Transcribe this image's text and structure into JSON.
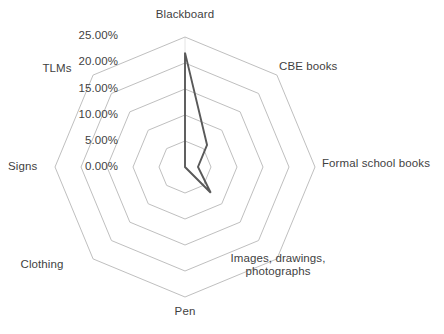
{
  "chart_data": {
    "type": "radar",
    "title": "",
    "subtitle": "",
    "xlabel": "",
    "ylabel": "",
    "categories": [
      "Blackboard",
      "CBE books",
      "Formal school books",
      "Images, drawings, photographs",
      "Pen",
      "Clothing",
      "Signs",
      "TLMs"
    ],
    "values": [
      22.0,
      6.0,
      2.5,
      7.0,
      0.0,
      0.0,
      0.0,
      0.0
    ],
    "value_unit": "%",
    "tick_labels": [
      "0.00%",
      "5.00%",
      "10.00%",
      "15.00%",
      "20.00%",
      "25.00%"
    ],
    "tick_values": [
      0,
      5,
      10,
      15,
      20,
      25
    ],
    "rlim": [
      0,
      25
    ],
    "grid": true,
    "legend": false,
    "legend_position": "none",
    "series": [
      {
        "name": "Series 1",
        "values": [
          22.0,
          6.0,
          2.5,
          7.0,
          0.0,
          0.0,
          0.0,
          0.0
        ]
      }
    ],
    "colors": {
      "grid": "#bfbfbf",
      "series_line": "#595959",
      "text": "#3f3f3f",
      "background": "#ffffff"
    }
  },
  "axis_labels": [
    {
      "text": "Blackboard",
      "x": 185,
      "y": 8,
      "w": 120,
      "align": "center"
    },
    {
      "text": "CBE books",
      "x": 279,
      "y": 60,
      "w": 120,
      "align": "left"
    },
    {
      "text": "Formal school books",
      "x": 322,
      "y": 157,
      "w": 125,
      "align": "left"
    },
    {
      "text": "Images, drawings,\nphotographs",
      "x": 278,
      "y": 252,
      "w": 110,
      "align": "center"
    },
    {
      "text": "Pen",
      "x": 185,
      "y": 305,
      "w": 60,
      "align": "center"
    },
    {
      "text": "Clothing",
      "x": 42,
      "y": 258,
      "w": 70,
      "align": "center"
    },
    {
      "text": "Signs",
      "x": 8,
      "y": 160,
      "w": 55,
      "align": "left"
    },
    {
      "text": "TLMs",
      "x": 57,
      "y": 62,
      "w": 55,
      "align": "center"
    }
  ],
  "tick_labels": [
    {
      "text": "25.00%",
      "x": 118,
      "y": 29
    },
    {
      "text": "20.00%",
      "x": 118,
      "y": 55
    },
    {
      "text": "15.00%",
      "x": 118,
      "y": 82
    },
    {
      "text": "10.00%",
      "x": 118,
      "y": 108
    },
    {
      "text": "5.00%",
      "x": 118,
      "y": 134
    },
    {
      "text": "0.00%",
      "x": 118,
      "y": 160
    }
  ],
  "geometry": {
    "cx": 185,
    "cy": 167,
    "radius": 130,
    "num_axes": 8,
    "num_rings": 5
  }
}
